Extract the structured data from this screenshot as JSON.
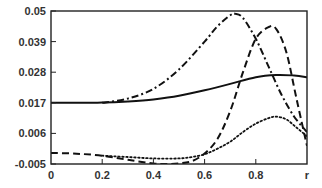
{
  "chart_data": {
    "type": "line",
    "title": "",
    "xlabel": "r",
    "ylabel": "",
    "xlim": [
      0,
      1.0
    ],
    "ylim": [
      -0.005,
      0.05
    ],
    "x_ticks": [
      0,
      0.2,
      0.4,
      0.6,
      0.8
    ],
    "x_tick_labels": [
      "0",
      "0.2",
      "0.4",
      "0.6",
      "0.8",
      "r"
    ],
    "y_ticks": [
      -0.005,
      0.006,
      0.017,
      0.028,
      0.039,
      0.05
    ],
    "y_tick_labels": [
      "-0.005",
      "0.006",
      "0.017",
      "0.028",
      "0.039",
      "0.05"
    ],
    "grid": false,
    "legend": null,
    "series": [
      {
        "name": "solid",
        "style": "solid",
        "x": [
          0,
          0.1,
          0.2,
          0.3,
          0.4,
          0.5,
          0.6,
          0.7,
          0.8,
          0.88,
          0.95,
          1.0
        ],
        "y": [
          0.017,
          0.017,
          0.0171,
          0.0175,
          0.0182,
          0.0195,
          0.0215,
          0.0238,
          0.0262,
          0.027,
          0.0268,
          0.0262
        ]
      },
      {
        "name": "dash-dot",
        "style": "dashdot",
        "x": [
          0.2,
          0.3,
          0.4,
          0.5,
          0.6,
          0.65,
          0.7,
          0.72,
          0.75,
          0.8,
          0.85,
          0.9,
          0.95,
          1.0
        ],
        "y": [
          0.017,
          0.0185,
          0.022,
          0.029,
          0.039,
          0.0445,
          0.0485,
          0.049,
          0.0475,
          0.04,
          0.03,
          0.02,
          0.012,
          0.0065
        ]
      },
      {
        "name": "dashed",
        "style": "dashed",
        "x": [
          0,
          0.1,
          0.2,
          0.3,
          0.4,
          0.45,
          0.5,
          0.55,
          0.6,
          0.65,
          0.7,
          0.75,
          0.8,
          0.85,
          0.88,
          0.92,
          0.96,
          1.0
        ],
        "y": [
          -0.001,
          -0.0013,
          -0.002,
          -0.0035,
          -0.0048,
          -0.005,
          -0.0048,
          -0.004,
          -0.0012,
          0.004,
          0.014,
          0.028,
          0.04,
          0.0442,
          0.0435,
          0.035,
          0.018,
          0.0015
        ]
      },
      {
        "name": "dotted",
        "style": "dotted",
        "x": [
          0.2,
          0.3,
          0.4,
          0.5,
          0.55,
          0.6,
          0.65,
          0.7,
          0.75,
          0.8,
          0.85,
          0.88,
          0.92,
          0.96,
          1.0
        ],
        "y": [
          -0.002,
          -0.0025,
          -0.003,
          -0.003,
          -0.0025,
          -0.0015,
          0.0005,
          0.003,
          0.0065,
          0.0095,
          0.0115,
          0.012,
          0.011,
          0.008,
          0.005
        ]
      }
    ]
  }
}
